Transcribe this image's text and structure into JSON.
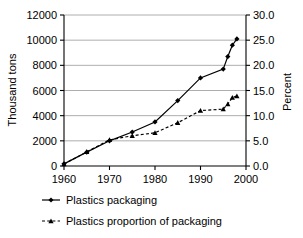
{
  "chart_data": {
    "type": "line",
    "title": "",
    "xlabel": "",
    "ylabel": "Thousand tons",
    "y2label": "Percent",
    "xlim": [
      1960,
      2000
    ],
    "ylim": [
      0,
      12000
    ],
    "y2lim": [
      0.0,
      30.0
    ],
    "grid": true,
    "legend_position": "bottom-left",
    "x_ticks": [
      "1960",
      "1970",
      "1980",
      "1990",
      "2000"
    ],
    "x_tick_values": [
      1960,
      1970,
      1980,
      1990,
      2000
    ],
    "y_ticks": [
      "0",
      "2000",
      "4000",
      "6000",
      "8000",
      "10000",
      "12000"
    ],
    "y_tick_values": [
      0,
      2000,
      4000,
      6000,
      8000,
      10000,
      12000
    ],
    "y2_ticks": [
      "0.0",
      "5.0",
      "10.0",
      "15.0",
      "20.0",
      "25.0",
      "30.0"
    ],
    "y2_tick_values": [
      0.0,
      5.0,
      10.0,
      15.0,
      20.0,
      25.0,
      30.0
    ],
    "series": [
      {
        "name": "Plastics packaging",
        "axis": "left",
        "marker": "diamond",
        "linestyle": "solid",
        "color": "#000000",
        "x": [
          1960,
          1965,
          1970,
          1975,
          1980,
          1985,
          1990,
          1995,
          1996,
          1997,
          1998
        ],
        "values": [
          170,
          1100,
          2000,
          2700,
          3500,
          5200,
          7000,
          7700,
          8700,
          9600,
          10100
        ]
      },
      {
        "name": "Plastics proportion of packaging",
        "axis": "right",
        "marker": "triangle",
        "linestyle": "dashed",
        "color": "#000000",
        "x": [
          1960,
          1965,
          1970,
          1975,
          1980,
          1985,
          1990,
          1995,
          1996,
          1997,
          1998
        ],
        "values": [
          0.4,
          2.8,
          5.2,
          6.0,
          6.6,
          8.6,
          11.0,
          11.3,
          12.3,
          13.6,
          13.9
        ]
      }
    ],
    "legend": [
      {
        "label": "Plastics packaging",
        "marker": "diamond",
        "linestyle": "solid"
      },
      {
        "label": "Plastics proportion of packaging",
        "marker": "triangle",
        "linestyle": "dashed"
      }
    ],
    "colors": {
      "axis": "#000000",
      "grid": "#999999",
      "line": "#000000",
      "background": "#ffffff"
    }
  }
}
